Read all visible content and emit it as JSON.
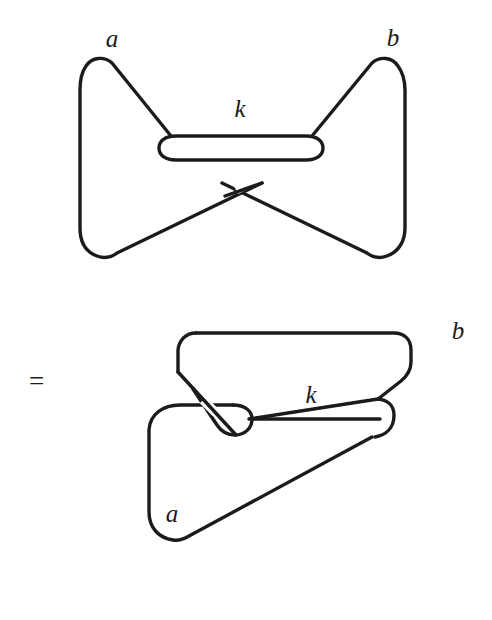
{
  "figure": {
    "kind": "knot-diagram-equation",
    "background_color": "#ffffff",
    "stroke_color": "#1b1b1b",
    "relation_symbol": "=",
    "diagrams": [
      {
        "name": "top-diagram",
        "description": "bowtie knot with two lobes joined through a flattened k-loop",
        "labels": [
          {
            "text": "a",
            "x": 112,
            "y": 47
          },
          {
            "text": "b",
            "x": 393,
            "y": 46
          },
          {
            "text": "k",
            "x": 240,
            "y": 117
          }
        ]
      },
      {
        "name": "bottom-diagram",
        "description": "deformed knot, upper rounded quadrilateral loop passing through small k-loop over lower a-loop",
        "labels": [
          {
            "text": "b",
            "x": 458,
            "y": 339
          },
          {
            "text": "k",
            "x": 311,
            "y": 403
          },
          {
            "text": "a",
            "x": 172,
            "y": 522
          }
        ]
      }
    ],
    "equals": {
      "text": "=",
      "x": 29,
      "y": 390
    }
  }
}
